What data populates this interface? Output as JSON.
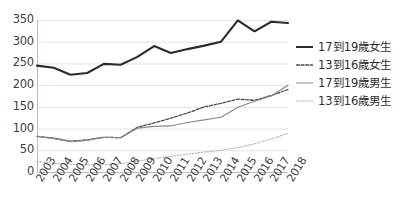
{
  "chart_data": {
    "type": "line",
    "title": "",
    "subtitle": "",
    "xlabel": "",
    "ylabel": "",
    "categories": [
      "2003",
      "2004",
      "2005",
      "2006",
      "2007",
      "2008",
      "2009",
      "2010",
      "2011",
      "2012",
      "2013",
      "2014",
      "2015",
      "2016",
      "2017",
      "2018"
    ],
    "x": [
      2003,
      2004,
      2005,
      2006,
      2007,
      2008,
      2009,
      2010,
      2011,
      2012,
      2013,
      2014,
      2015,
      2016,
      2017,
      2018
    ],
    "ylim": [
      0,
      350
    ],
    "ytick_values": [
      0,
      50,
      100,
      150,
      200,
      250,
      300,
      350
    ],
    "ytick_labels": [
      "0",
      "50",
      "100",
      "150",
      "200",
      "250",
      "300",
      "350"
    ],
    "grid": "horizontal",
    "legend_position": "right",
    "series": [
      {
        "name": "17到19歲女生",
        "style": "solid-thick",
        "color": "#2b2b2b",
        "values": [
          245,
          240,
          224,
          228,
          249,
          247,
          265,
          290,
          274,
          283,
          291,
          300,
          349,
          324,
          346,
          343
        ]
      },
      {
        "name": "13到16歲女生",
        "style": "dashed",
        "color": "#4a4a4a",
        "values": [
          82,
          78,
          71,
          74,
          80,
          79,
          103,
          113,
          124,
          136,
          150,
          158,
          168,
          165,
          176,
          190
        ]
      },
      {
        "name": "17到19歲男生",
        "style": "solid-thin",
        "color": "#8a8a8a",
        "values": [
          82,
          77,
          70,
          73,
          80,
          79,
          101,
          105,
          106,
          114,
          120,
          126,
          149,
          163,
          175,
          200
        ]
      },
      {
        "name": "13到16歲男生",
        "style": "dotted",
        "color": "#b4b4b4",
        "values": [
          24,
          20,
          18,
          16,
          17,
          19,
          25,
          31,
          36,
          41,
          46,
          50,
          56,
          65,
          76,
          89
        ]
      }
    ]
  },
  "legend": {
    "items": [
      {
        "label": "17到19歲女生",
        "key": "line-key-solid-thick"
      },
      {
        "label": "13到16歲女生",
        "key": "line-key-dashed"
      },
      {
        "label": "17到19歲男生",
        "key": "line-key-solid-thin"
      },
      {
        "label": "13到16歲男生",
        "key": "line-key-dotted"
      }
    ]
  },
  "axes": {
    "y_labels": [
      "350",
      "300",
      "250",
      "200",
      "150",
      "100",
      "50",
      "0"
    ],
    "x_labels": [
      "2003",
      "2004",
      "2005",
      "2006",
      "2007",
      "2008",
      "2009",
      "2010",
      "2011",
      "2012",
      "2013",
      "2014",
      "2015",
      "2016",
      "2017",
      "2018"
    ]
  },
  "colors": {
    "grid": "#e3e3e3",
    "axis": "#bdbdbd",
    "series_1": "#2b2b2b",
    "series_2": "#4a4a4a",
    "series_3": "#8a8a8a",
    "series_4": "#b4b4b4",
    "text": "#3f3f3f",
    "background": "#ffffff"
  }
}
